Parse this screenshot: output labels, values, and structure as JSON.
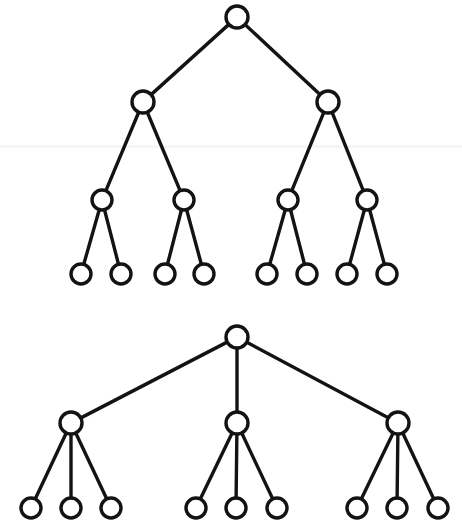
{
  "figure": {
    "background_color": "#ffffff",
    "stroke_color": "#131313",
    "node_fill_color": "#ffffff",
    "node_radius": 11,
    "leaf_radius": 10,
    "edge_width": 3.4,
    "width": 462,
    "height": 532,
    "diagram_count": 2
  },
  "artifacts": {
    "scanline": {
      "x": 0,
      "y": 145,
      "width": 462,
      "height": 3,
      "color": "#f4f4f6"
    }
  },
  "diagrams": [
    {
      "id": "binary-tree",
      "label": "Complete binary tree of depth 3",
      "branching_factor": 2,
      "depth": 3,
      "node_count": 15,
      "leaf_count": 8,
      "levels": [
        {
          "level": 0,
          "label": "root",
          "nodes": [
            {
              "id": "b-r",
              "cx": 237,
              "cy": 17,
              "r": 11
            }
          ]
        },
        {
          "level": 1,
          "label": "internal-level-1",
          "nodes": [
            {
              "id": "b-1",
              "cx": 143,
              "cy": 102,
              "r": 11
            },
            {
              "id": "b-2",
              "cx": 328,
              "cy": 102,
              "r": 11
            }
          ]
        },
        {
          "level": 2,
          "label": "internal-level-2",
          "nodes": [
            {
              "id": "b-11",
              "cx": 102,
              "cy": 200,
              "r": 10
            },
            {
              "id": "b-12",
              "cx": 184,
              "cy": 200,
              "r": 10
            },
            {
              "id": "b-21",
              "cx": 288,
              "cy": 200,
              "r": 10
            },
            {
              "id": "b-22",
              "cx": 367,
              "cy": 200,
              "r": 10
            }
          ]
        },
        {
          "level": 3,
          "label": "leaves",
          "nodes": [
            {
              "id": "b-111",
              "cx": 81,
              "cy": 274,
              "r": 10
            },
            {
              "id": "b-112",
              "cx": 121,
              "cy": 274,
              "r": 10
            },
            {
              "id": "b-121",
              "cx": 165,
              "cy": 274,
              "r": 10
            },
            {
              "id": "b-122",
              "cx": 204,
              "cy": 274,
              "r": 10
            },
            {
              "id": "b-211",
              "cx": 267,
              "cy": 274,
              "r": 10
            },
            {
              "id": "b-212",
              "cx": 307,
              "cy": 274,
              "r": 10
            },
            {
              "id": "b-221",
              "cx": 347,
              "cy": 274,
              "r": 10
            },
            {
              "id": "b-222",
              "cx": 387,
              "cy": 274,
              "r": 10
            }
          ]
        }
      ],
      "edges": [
        {
          "from": "b-r",
          "to": "b-1"
        },
        {
          "from": "b-r",
          "to": "b-2"
        },
        {
          "from": "b-1",
          "to": "b-11"
        },
        {
          "from": "b-1",
          "to": "b-12"
        },
        {
          "from": "b-2",
          "to": "b-21"
        },
        {
          "from": "b-2",
          "to": "b-22"
        },
        {
          "from": "b-11",
          "to": "b-111"
        },
        {
          "from": "b-11",
          "to": "b-112"
        },
        {
          "from": "b-12",
          "to": "b-121"
        },
        {
          "from": "b-12",
          "to": "b-122"
        },
        {
          "from": "b-21",
          "to": "b-211"
        },
        {
          "from": "b-21",
          "to": "b-212"
        },
        {
          "from": "b-22",
          "to": "b-221"
        },
        {
          "from": "b-22",
          "to": "b-222"
        }
      ]
    },
    {
      "id": "ternary-tree",
      "label": "Complete ternary tree of depth 2",
      "branching_factor": 3,
      "depth": 2,
      "node_count": 13,
      "leaf_count": 9,
      "levels": [
        {
          "level": 0,
          "label": "root",
          "nodes": [
            {
              "id": "t-r",
              "cx": 237,
              "cy": 337,
              "r": 11
            }
          ]
        },
        {
          "level": 1,
          "label": "internal-level-1",
          "nodes": [
            {
              "id": "t-1",
              "cx": 71,
              "cy": 423,
              "r": 11
            },
            {
              "id": "t-2",
              "cx": 237,
              "cy": 423,
              "r": 11
            },
            {
              "id": "t-3",
              "cx": 398,
              "cy": 423,
              "r": 11
            }
          ]
        },
        {
          "level": 2,
          "label": "leaves",
          "nodes": [
            {
              "id": "t-11",
              "cx": 31,
              "cy": 508,
              "r": 10
            },
            {
              "id": "t-12",
              "cx": 71,
              "cy": 508,
              "r": 10
            },
            {
              "id": "t-13",
              "cx": 111,
              "cy": 508,
              "r": 10
            },
            {
              "id": "t-21",
              "cx": 196,
              "cy": 508,
              "r": 10
            },
            {
              "id": "t-22",
              "cx": 236,
              "cy": 508,
              "r": 10
            },
            {
              "id": "t-23",
              "cx": 277,
              "cy": 508,
              "r": 10
            },
            {
              "id": "t-31",
              "cx": 357,
              "cy": 508,
              "r": 10
            },
            {
              "id": "t-32",
              "cx": 397,
              "cy": 508,
              "r": 10
            },
            {
              "id": "t-33",
              "cx": 438,
              "cy": 508,
              "r": 10
            }
          ]
        }
      ],
      "edges": [
        {
          "from": "t-r",
          "to": "t-1"
        },
        {
          "from": "t-r",
          "to": "t-2"
        },
        {
          "from": "t-r",
          "to": "t-3"
        },
        {
          "from": "t-1",
          "to": "t-11"
        },
        {
          "from": "t-1",
          "to": "t-12"
        },
        {
          "from": "t-1",
          "to": "t-13"
        },
        {
          "from": "t-2",
          "to": "t-21"
        },
        {
          "from": "t-2",
          "to": "t-22"
        },
        {
          "from": "t-2",
          "to": "t-23"
        },
        {
          "from": "t-3",
          "to": "t-31"
        },
        {
          "from": "t-3",
          "to": "t-32"
        },
        {
          "from": "t-3",
          "to": "t-33"
        }
      ]
    }
  ]
}
